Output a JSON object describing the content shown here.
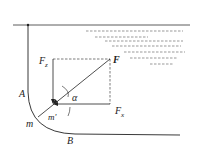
{
  "diagram": {
    "labels": {
      "F": "F",
      "Fz": "F",
      "Fz_sub": "z",
      "Fx": "F",
      "Fx_sub": "x",
      "alpha": "α",
      "m_prime": "m'",
      "m": "m",
      "A": "A",
      "B": "B"
    },
    "colors": {
      "line": "#222222",
      "dash": "#444444"
    }
  }
}
